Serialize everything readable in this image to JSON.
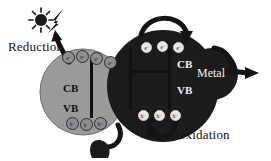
{
  "diagram": {
    "background": "#ffffff",
    "colors": {
      "semiconductor_left": "#9a9a9a",
      "semiconductor_right": "#1b1b1b",
      "metal": "#1b1b1b",
      "arrow": "#141414",
      "band_bar": "#101010",
      "carrier_light": "#e8e8e8",
      "carrier_dark": "#8e8e8e",
      "text_dark": "#111111",
      "text_light": "#f2f2f2"
    }
  },
  "labels": {
    "reduction": "Reduction",
    "oxidation": "Oxidation",
    "metal": "Metal",
    "cb_left": "CB",
    "vb_left": "VB",
    "cb_right": "CB",
    "vb_right": "VB"
  },
  "icons": {
    "sun": "sun-icon",
    "lightning": "lightning-bolt-icon",
    "arrow_reduction": "reduction-arrow-icon",
    "arrow_oxidation": "oxidation-arrow-icon",
    "arrow_interparticle": "electron-transfer-arrow-icon",
    "arrow_metal_out": "metal-output-arrow-icon"
  },
  "carriers": {
    "electron_symbol": "e",
    "electron_charge": "-",
    "hole_symbol": "h",
    "hole_charge": "+",
    "left_electrons": [
      {
        "label": "e",
        "charge": "-",
        "x": 62,
        "y": 51
      },
      {
        "label": "e",
        "charge": "-",
        "x": 76,
        "y": 50
      },
      {
        "label": "e",
        "charge": "-",
        "x": 90,
        "y": 52
      },
      {
        "label": "e",
        "charge": "-",
        "x": 104,
        "y": 56
      }
    ],
    "left_holes": [
      {
        "label": "h",
        "charge": "+",
        "x": 66,
        "y": 117
      },
      {
        "label": "h",
        "charge": "+",
        "x": 80,
        "y": 118
      },
      {
        "label": "h",
        "charge": "+",
        "x": 94,
        "y": 117
      }
    ],
    "right_electrons": [
      {
        "label": "e",
        "charge": "-",
        "x": 141,
        "y": 42
      },
      {
        "label": "e",
        "charge": "-",
        "x": 157,
        "y": 41
      },
      {
        "label": "e",
        "charge": "-",
        "x": 173,
        "y": 42
      }
    ],
    "right_holes": [
      {
        "label": "h",
        "charge": "+",
        "x": 138,
        "y": 110
      },
      {
        "label": "h",
        "charge": "+",
        "x": 154,
        "y": 110
      },
      {
        "label": "h",
        "charge": "+",
        "x": 170,
        "y": 110
      }
    ]
  }
}
